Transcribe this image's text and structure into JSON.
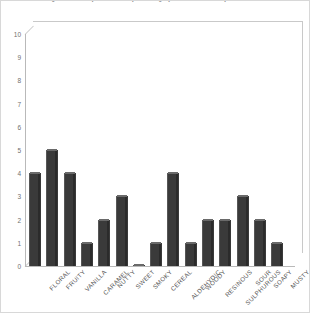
{
  "figure": {
    "caption_fragment": "a sensory descriptor frequency profile sample"
  },
  "chart_data": {
    "type": "bar",
    "title": "",
    "subtitle": "",
    "xlabel": "",
    "ylabel": "",
    "ylim": [
      0,
      10
    ],
    "y_ticks": [
      10,
      9,
      8,
      7,
      6,
      5,
      4,
      3,
      2,
      1,
      0
    ],
    "grid": false,
    "legend": false,
    "legend_position": "none",
    "bar_color": "#3a3a3a",
    "bar_top_color": "#6a6a6a",
    "axis_color": "#b9b9b9",
    "plot_background": "#ffffff",
    "categories": [
      "FLORAL",
      "FRUITY",
      "VANILLA",
      "CARAMEL",
      "NUTTY",
      "SWEET",
      "SMOKY",
      "CEREAL",
      "ALDEHYDIC",
      "WOODY",
      "RESINOUS",
      "SULPHUROUS",
      "SOUR",
      "SOAPY",
      "MUSTY"
    ],
    "values": [
      4,
      5,
      4,
      1,
      2,
      3,
      0.05,
      1,
      4,
      1,
      2,
      2,
      3,
      2,
      1
    ]
  }
}
